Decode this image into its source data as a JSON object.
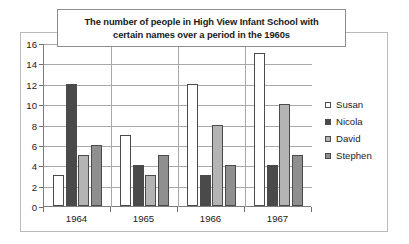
{
  "chart_data": {
    "type": "bar",
    "title": "The number of people in High View Infant School with certain names over a period in the 1960s",
    "title_line1": "The number of people in High View Infant School with",
    "title_line2": "certain names over a period in the 1960s",
    "xlabel": "",
    "ylabel": "",
    "ylim": [
      0,
      16
    ],
    "ytick_step": 2,
    "yticks": [
      0,
      2,
      4,
      6,
      8,
      10,
      12,
      14,
      16
    ],
    "ytick_labels": [
      "0",
      "2",
      "4",
      "6",
      "8",
      "10",
      "12",
      "14",
      "16"
    ],
    "grid": true,
    "grid_axis": "y",
    "legend_position": "right",
    "categories": [
      "1964",
      "1965",
      "1966",
      "1967"
    ],
    "series": [
      {
        "name": "Susan",
        "color": "#ffffff",
        "values": [
          3,
          7,
          12,
          15
        ]
      },
      {
        "name": "Nicola",
        "color": "#4a4a4a",
        "values": [
          12,
          4,
          3,
          4
        ]
      },
      {
        "name": "David",
        "color": "#b4b4b4",
        "values": [
          5,
          3,
          8,
          10
        ]
      },
      {
        "name": "Stephen",
        "color": "#8f8f8f",
        "values": [
          6,
          5,
          4,
          5
        ]
      }
    ]
  },
  "axes": {
    "tick_color": "#6f6f6f",
    "grid_color": "#a8a8a8",
    "bar_outline": "#4b4b4b"
  }
}
